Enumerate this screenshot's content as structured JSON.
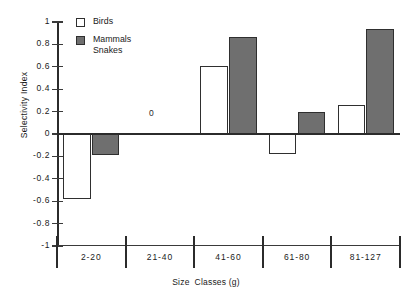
{
  "chart_data": {
    "type": "bar",
    "title": "",
    "xlabel": "Size  Classes (g)",
    "ylabel": "Selectivity Index",
    "categories": [
      "2-20",
      "21-40",
      "41-60",
      "61-80",
      "81-127"
    ],
    "ylim": [
      -1,
      1
    ],
    "yticks": [
      "1",
      "0.8",
      "0.6",
      "0.4",
      "0.2",
      "0",
      "-0.2",
      "-0.4",
      "-0.6",
      "-0.8",
      "-1"
    ],
    "ytick_values": [
      1,
      0.8,
      0.6,
      0.4,
      0.2,
      0,
      -0.2,
      -0.4,
      -0.6,
      -0.8,
      -1
    ],
    "grid": false,
    "legend_position": "top-left",
    "series": [
      {
        "name": "Birds",
        "color": "#ffffff",
        "values": [
          -0.58,
          0,
          0.61,
          -0.18,
          0.26
        ]
      },
      {
        "name": "Mammals Snakes",
        "color": "#6f6f6f",
        "values": [
          -0.19,
          0,
          0.87,
          0.2,
          0.94
        ]
      }
    ],
    "annotations": [
      {
        "text": "0",
        "category": "21-40",
        "value": 0.18
      }
    ]
  },
  "legend": {
    "items": [
      {
        "label": "Birds",
        "label2": "",
        "swatch": "birds"
      },
      {
        "label": "Mammals",
        "label2": "Snakes",
        "swatch": "mammals"
      }
    ]
  },
  "axes": {
    "y_title": "Selectivity Index",
    "x_title_part1": "Size",
    "x_title_part2": "Classes (g)"
  },
  "colors": {
    "bar_fill_birds": "#ffffff",
    "bar_fill_mammals": "#6f6f6f",
    "bar_stroke": "#2f2f2f",
    "axis": "#2b2b2b",
    "text": "#1a1a1a"
  }
}
